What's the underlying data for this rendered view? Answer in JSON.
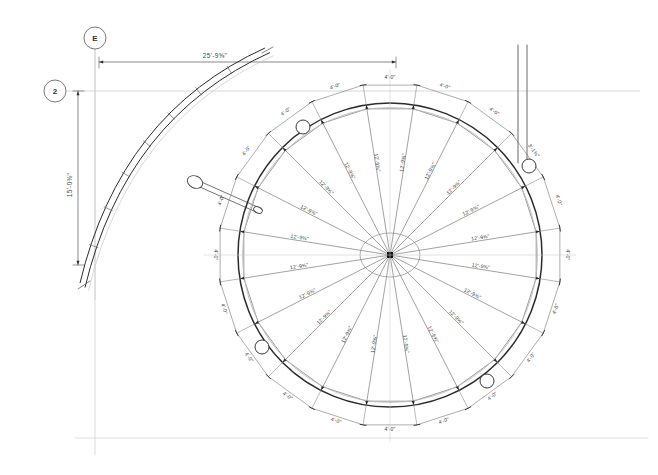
{
  "sheet": {
    "width": 658,
    "height": 475,
    "background": "#ffffff",
    "line_color": "#4a4a4a",
    "heavy_line_color": "#2b2b2b",
    "faint_line_color": "#c9c9c9",
    "text_color": "#3a3a3a"
  },
  "grid_bubbles": [
    {
      "name": "grid-bubble-e",
      "label": "E",
      "cx": 95,
      "cy": 38,
      "r": 11,
      "axis": "vertical",
      "line_to": [
        95,
        300
      ]
    },
    {
      "name": "grid-bubble-2",
      "label": "2",
      "cx": 55,
      "cy": 91,
      "r": 11,
      "axis": "horizontal",
      "line_to": [
        640,
        91
      ]
    }
  ],
  "overall_dimensions": [
    {
      "name": "overall-horizontal-dimension",
      "label": "25'-9⅝\"",
      "x1": 99,
      "y1": 62,
      "x2": 396,
      "y2": 62,
      "orientation": "horizontal",
      "text_x": 215,
      "text_y": 58
    },
    {
      "name": "overall-vertical-dimension",
      "label": "15'-0⅜\"",
      "x1": 78,
      "y1": 91,
      "x2": 78,
      "y2": 265,
      "orientation": "vertical",
      "text_x": 72,
      "text_y": 185
    }
  ],
  "radial_plan": {
    "name": "radial-canopy-plan",
    "center": {
      "x": 390,
      "y": 255
    },
    "hub_radius": 3.0,
    "hub_ring_rx": 30,
    "hub_ring_ry": 22,
    "inner_ring_radius": 148,
    "outer_ring_radius": 152,
    "dim_ring_radius": 172,
    "spoke_count": 20,
    "start_angle_deg": -99,
    "radius_label": "12'-9⅝\"",
    "chord_label": "4'-0\"",
    "radius_labels": [
      "12'-9⅝\"",
      "12'-9⅝\"",
      "12'-9⅝\"",
      "12'-9⅝\"",
      "12'-9⅝\"",
      "12'-9⅝\"",
      "12'-9⅝\"",
      "12'-9⅝\"",
      "12'-9⅝\"",
      "12'-9⅝\"",
      "12'-9⅝\"",
      "12'-9⅝\"",
      "12'-9⅝\"",
      "12'-9⅝\"",
      "12'-9⅝\"",
      "12'-9⅝\"",
      "12'-9⅝\"",
      "12'-9⅝\"",
      "12'-9⅝\"",
      "12'-9⅝\""
    ],
    "chord_labels": [
      "4'-0\"",
      "4'-0\"",
      "4'-0\"",
      "4'-0\"",
      "4'-0\"",
      "4'-0\"",
      "4'-0\"",
      "4'-0\"",
      "4'-0\"",
      "4'-0\"",
      "4'-0\"",
      "4'-0\"",
      "4'-0\"",
      "4'-0\"",
      "4'-0\"",
      "4'-0\"",
      "4'-0\"",
      "4'-0\"",
      "4'-0\"",
      "4'-0\""
    ],
    "special_chord": {
      "label": "3'-1⅜\"",
      "index": 3
    }
  },
  "node_markers": [
    {
      "name": "node-marker-upper-left",
      "cx": 303,
      "cy": 127,
      "r": 7
    },
    {
      "name": "node-marker-upper-right",
      "cx": 529,
      "cy": 166,
      "r": 7
    },
    {
      "name": "node-marker-lower-left",
      "cx": 262,
      "cy": 347,
      "r": 7
    },
    {
      "name": "node-marker-lower-right",
      "cx": 487,
      "cy": 381,
      "r": 7
    }
  ],
  "curved_wall": {
    "name": "curved-wall-ramp",
    "description": "curved double-line wall at upper left with tick marks",
    "tick_count": 7,
    "start": [
      80,
      283
    ],
    "end": [
      265,
      48
    ]
  },
  "connector_strut": {
    "name": "connector-strut",
    "from": [
      195,
      182
    ],
    "to": [
      258,
      210
    ],
    "node_rx": 8,
    "node_ry": 6
  },
  "vertical_lines": {
    "name": "vertical-leader-lines",
    "x1": 518,
    "x2": 527,
    "y_top": 45,
    "y_bottom": 163
  },
  "page_guides": [
    {
      "name": "page-guide-bottom",
      "x1": 75,
      "y1": 438,
      "x2": 648,
      "y2": 438
    },
    {
      "name": "page-guide-left",
      "x1": 95,
      "y1": 38,
      "x2": 95,
      "y2": 455
    }
  ]
}
